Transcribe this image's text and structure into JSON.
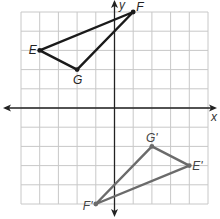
{
  "diagram": {
    "type": "coordinate-plane-transformation",
    "grid": {
      "cols": 10,
      "rows": 10,
      "x_min": -5,
      "x_max": 5,
      "y_min": -5,
      "y_max": 5
    },
    "axes": {
      "x_label": "x",
      "y_label": "y"
    },
    "original_triangle": {
      "color": "#1a1a1a",
      "vertices": [
        {
          "label": "E",
          "x": -4,
          "y": 3
        },
        {
          "label": "F",
          "x": 1,
          "y": 5
        },
        {
          "label": "G",
          "x": -2,
          "y": 2
        }
      ]
    },
    "image_triangle": {
      "color": "#6b6b6b",
      "vertices": [
        {
          "label": "E'",
          "x": 4,
          "y": -3
        },
        {
          "label": "F'",
          "x": -1,
          "y": -5
        },
        {
          "label": "G'",
          "x": 2,
          "y": -2
        }
      ]
    }
  }
}
